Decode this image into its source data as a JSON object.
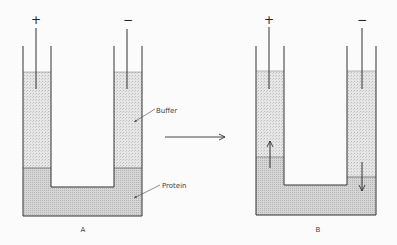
{
  "diagram": {
    "panels": [
      {
        "id": "A",
        "caption": "A",
        "anode_symbol": "+",
        "cathode_symbol": "−",
        "labels": {
          "buffer": "Buffer",
          "protein": "Protein"
        },
        "state": "initial boundaries level"
      },
      {
        "id": "B",
        "caption": "B",
        "anode_symbol": "+",
        "cathode_symbol": "−",
        "state": "boundary rises on + side, falls on − side"
      }
    ],
    "transition_arrow": "right-arrow",
    "colors": {
      "stroke": "#333333",
      "buffer_fill": "#e4e4e4",
      "protein_fill": "#d2d2d2",
      "background": "#fbfbfb"
    }
  }
}
